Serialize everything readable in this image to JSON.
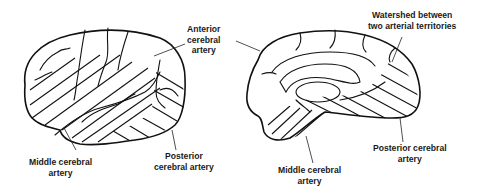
{
  "figure": {
    "lateral_view": {
      "labels": {
        "anterior": [
          "Anterior",
          "cerebral",
          "artery"
        ],
        "middle": [
          "Middle cerebral",
          "artery"
        ],
        "posterior": [
          "Posterior",
          "cerebral artery"
        ]
      }
    },
    "medial_view": {
      "labels": {
        "watershed": [
          "Watershed between",
          "two arterial territories"
        ],
        "middle": [
          "Middle cerebral",
          "artery"
        ],
        "posterior": [
          "Posterior cerebral",
          "artery"
        ]
      }
    },
    "colors": {
      "line": "#111111",
      "background": "#ffffff",
      "text": "#1a1a1a"
    }
  }
}
